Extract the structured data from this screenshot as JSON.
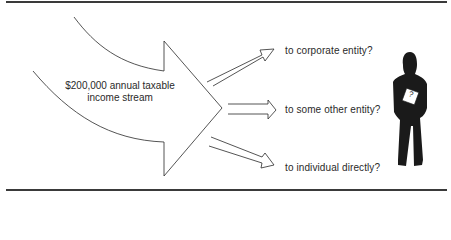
{
  "diagram": {
    "source": {
      "line1": "$200,000 annual taxable",
      "line2": "income stream"
    },
    "destinations": [
      {
        "label": "to corporate entity?"
      },
      {
        "label": "to some other entity?"
      },
      {
        "label": "to individual directly?"
      }
    ],
    "figure": {
      "badge": "?"
    },
    "colors": {
      "stroke": "#2a2a2a",
      "figure": "#1a1a1a",
      "rule": "#3a3a3a"
    }
  }
}
